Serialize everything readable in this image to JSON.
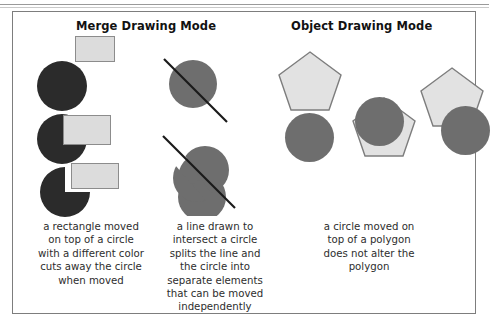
{
  "figure": {
    "headings": {
      "merge": "Merge Drawing Mode",
      "object": "Object Drawing Mode"
    },
    "colors": {
      "dark_shape": "#2b2b2b",
      "medium_shape": "#6e6e6e",
      "light_shape": "#dcdcdc",
      "outline": "#8c8c8c",
      "frame_border": "#7d7d7d",
      "line_stroke": "#1a1a1a",
      "text": "#2d2d2d",
      "heading_text": "#121212",
      "background": "#ffffff"
    },
    "columns": [
      {
        "id": "merge-rectangle-circle",
        "mode": "Merge Drawing Mode",
        "caption_lines": [
          "a rectangle moved",
          "on top of a circle",
          "with a different color",
          "cuts away the circle",
          "when moved"
        ],
        "stages": [
          {
            "name": "separate",
            "shapes": [
              "dark circle",
              "light gray rectangle"
            ]
          },
          {
            "name": "overlapping",
            "shapes": [
              "dark circle",
              "light gray rectangle on top"
            ]
          },
          {
            "name": "after-move",
            "shapes": [
              "dark circle with corner cut away",
              "light gray rectangle moved aside"
            ]
          }
        ]
      },
      {
        "id": "merge-line-circle",
        "mode": "Merge Drawing Mode",
        "caption_lines": [
          "a line drawn to",
          "intersect a circle",
          "splits the line and",
          "the circle into",
          "separate elements",
          "that can be moved",
          "independently"
        ],
        "stages": [
          {
            "name": "line-across-circle",
            "shapes": [
              "medium gray circle",
              "diagonal line"
            ]
          },
          {
            "name": "circle-split",
            "shapes": [
              "medium gray circle split in two halves",
              "diagonal line"
            ]
          }
        ]
      },
      {
        "id": "object-pentagon-circle",
        "mode": "Object Drawing Mode",
        "caption_lines": [
          "a circle moved on",
          "top of a polygon",
          "does not alter the",
          "polygon"
        ],
        "stages": [
          {
            "name": "separate",
            "shapes": [
              "light gray pentagon",
              "medium gray circle"
            ]
          },
          {
            "name": "circle-on-top",
            "shapes": [
              "light gray pentagon",
              "medium gray circle on top"
            ]
          },
          {
            "name": "after-move",
            "shapes": [
              "light gray pentagon intact",
              "medium gray circle moved aside"
            ]
          }
        ]
      }
    ]
  }
}
